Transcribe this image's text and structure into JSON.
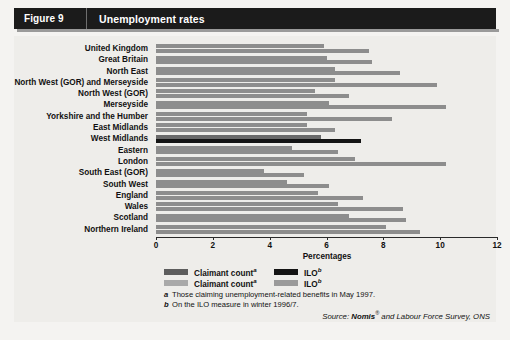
{
  "header": {
    "figure_label": "Figure 9",
    "title": "Unemployment rates"
  },
  "legend": {
    "claimant_dark_label": "Claimant count",
    "claimant_light_label": "Claimant count",
    "ilo_dark_label": "ILO",
    "ilo_light_label": "ILO",
    "claimant_mark": "a",
    "ilo_mark": "b"
  },
  "footnotes": [
    {
      "mark": "a",
      "text": "Those claiming unemployment-related benefits in May 1997."
    },
    {
      "mark": "b",
      "text": "On the ILO measure in winter 1996/7."
    }
  ],
  "source": {
    "prefix": "Source: ",
    "name": "Nomis",
    "sup": "®",
    "suffix": " and Labour Force Survey, ONS"
  },
  "colors": {
    "title_bar": "#1b1b1b",
    "panel_bg": "#eeedea",
    "bar_grey": "#8d8d8d",
    "bar_highlight": "#141414"
  },
  "chart_data": {
    "type": "bar",
    "orientation": "horizontal",
    "title": "Unemployment rates",
    "xlabel": "Percentages",
    "ylabel": "",
    "xlim": [
      0,
      12
    ],
    "xticks": [
      0,
      2,
      4,
      6,
      8,
      10,
      12
    ],
    "grid": false,
    "legend_position": "bottom",
    "highlight_category": "West Midlands",
    "categories": [
      "United Kingdom",
      "Great Britain",
      "North East",
      "North West (GOR) and Merseyside",
      "North West (GOR)",
      "Merseyside",
      "Yorkshire and the Humber",
      "East Midlands",
      "West Midlands",
      "Eastern",
      "London",
      "South East (GOR)",
      "South West",
      "England",
      "Wales",
      "Scotland",
      "Northern Ireland"
    ],
    "series": [
      {
        "name": "Claimant count",
        "values": [
          5.9,
          6.0,
          6.3,
          6.3,
          5.6,
          6.1,
          5.3,
          5.3,
          5.8,
          4.8,
          7.0,
          3.8,
          4.6,
          5.7,
          6.4,
          6.8,
          8.1
        ]
      },
      {
        "name": "ILO",
        "values": [
          7.5,
          7.6,
          8.6,
          9.9,
          6.8,
          10.2,
          8.3,
          6.3,
          7.2,
          6.4,
          10.2,
          5.2,
          6.1,
          7.3,
          8.7,
          8.8,
          9.3
        ]
      }
    ]
  }
}
